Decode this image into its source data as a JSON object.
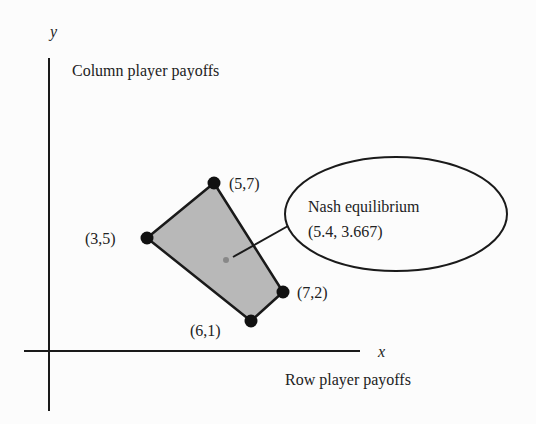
{
  "axes": {
    "x_label": "x",
    "y_label": "y",
    "x_title": "Row player payoffs",
    "y_title": "Column player payoffs"
  },
  "points": [
    {
      "label": "(5,7)",
      "x": 5,
      "y": 7
    },
    {
      "label": "(3,5)",
      "x": 3,
      "y": 5
    },
    {
      "label": "(7,2)",
      "x": 7,
      "y": 2
    },
    {
      "label": "(6,1)",
      "x": 6,
      "y": 1
    }
  ],
  "callout": {
    "title": "Nash equilibrium",
    "value": "(5.4, 3.667)"
  },
  "colors": {
    "region_fill": "#b8b8b8",
    "stroke": "#1a1a1a",
    "ne_point": "#888888"
  }
}
